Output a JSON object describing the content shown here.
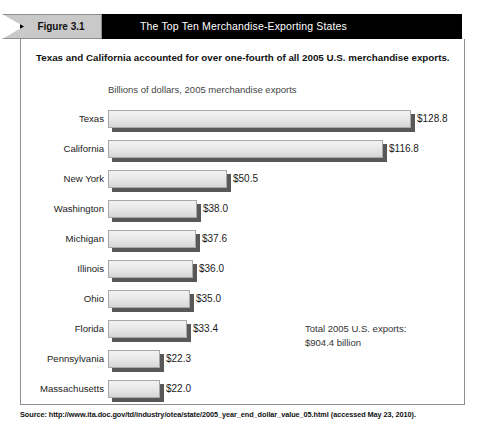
{
  "figure": {
    "tag": "Figure 3.1",
    "title": "The Top Ten Merchandise-Exporting States",
    "subtitle": "Texas and California accounted for over one-fourth of all 2005 U.S. merchandise exports.",
    "source": "Source: http://www.ita.doc.gov/td/industry/otea/state/2005_year_end_dollar_value_05.html (accessed May 23, 2010).",
    "annotation_line1": "Total 2005 U.S. exports:",
    "annotation_line2": "$904.4 billion",
    "accent_color": "#000000",
    "tag_color": "#c9c9c9",
    "bar_color": "#e9e9e9",
    "bar_shadow_color": "#585858"
  },
  "chart_data": {
    "type": "bar",
    "orientation": "horizontal",
    "title": "The Top Ten Merchandise-Exporting States",
    "subtitle": "Texas and California accounted for over one-fourth of all 2005 U.S. merchandise exports.",
    "xlabel": "Billions of dollars, 2005 merchandise exports",
    "ylabel": "",
    "grid": false,
    "legend": "none",
    "xlim": [
      0,
      128.8
    ],
    "units": "billions of U.S. dollars",
    "categories": [
      "Texas",
      "California",
      "New York",
      "Washington",
      "Michigan",
      "Illinois",
      "Ohio",
      "Florida",
      "Pennsylvania",
      "Massachusetts"
    ],
    "values": [
      128.8,
      116.8,
      50.5,
      38.0,
      37.6,
      36.0,
      35.0,
      33.4,
      22.3,
      22.0
    ],
    "data_labels": [
      "$128.8",
      "$116.8",
      "$50.5",
      "$38.0",
      "$37.6",
      "$36.0",
      "$35.0",
      "$33.4",
      "$22.3",
      "$22.0"
    ],
    "annotations": [
      "Total 2005 U.S. exports:",
      "$904.4 billion"
    ],
    "total_us_exports": 904.4,
    "rows": [
      {
        "label": "Texas",
        "value": 128.8,
        "data_label": "$128.8"
      },
      {
        "label": "California",
        "value": 116.8,
        "data_label": "$116.8"
      },
      {
        "label": "New York",
        "value": 50.5,
        "data_label": "$50.5"
      },
      {
        "label": "Washington",
        "value": 38.0,
        "data_label": "$38.0"
      },
      {
        "label": "Michigan",
        "value": 37.6,
        "data_label": "$37.6"
      },
      {
        "label": "Illinois",
        "value": 36.0,
        "data_label": "$36.0"
      },
      {
        "label": "Ohio",
        "value": 35.0,
        "data_label": "$35.0"
      },
      {
        "label": "Florida",
        "value": 33.4,
        "data_label": "$33.4"
      },
      {
        "label": "Pennsylvania",
        "value": 22.3,
        "data_label": "$22.3"
      },
      {
        "label": "Massachusetts",
        "value": 22.0,
        "data_label": "$22.0"
      }
    ]
  }
}
